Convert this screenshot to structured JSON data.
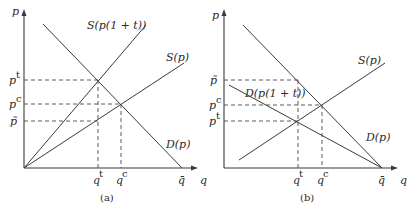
{
  "panels": [
    {
      "id": "a",
      "caption": "(a)",
      "y_axis_label": "p",
      "x_axis_label": "q",
      "curves": [
        {
          "name": "S(p(1+t))",
          "label": "S(p(1 + t))",
          "kind": "supply-with-tax"
        },
        {
          "name": "S(p)",
          "label": "S(p)",
          "kind": "supply"
        },
        {
          "name": "D(p)",
          "label": "D(p)",
          "kind": "demand"
        }
      ],
      "y_ticks": [
        {
          "base": "p",
          "mark": "t",
          "label": "p^t"
        },
        {
          "base": "p",
          "mark": "c",
          "label": "p^c"
        },
        {
          "base": "p̃",
          "mark": "",
          "label": "p̃"
        }
      ],
      "x_ticks": [
        {
          "base": "q",
          "mark": "t",
          "label": "q^t"
        },
        {
          "base": "q",
          "mark": "c",
          "label": "q^c"
        },
        {
          "base": "q̄",
          "mark": "",
          "label": "q̄"
        }
      ]
    },
    {
      "id": "b",
      "caption": "(b)",
      "y_axis_label": "p",
      "x_axis_label": "q",
      "curves": [
        {
          "name": "S(p)",
          "label": "S(p)",
          "kind": "supply"
        },
        {
          "name": "D(p(1+t))",
          "label": "D(p(1 + t))",
          "kind": "demand-with-tax"
        },
        {
          "name": "D(p)",
          "label": "D(p)",
          "kind": "demand"
        }
      ],
      "y_ticks": [
        {
          "base": "p̃",
          "mark": "",
          "label": "p̃"
        },
        {
          "base": "p",
          "mark": "c",
          "label": "p^c"
        },
        {
          "base": "p",
          "mark": "t",
          "label": "p^t"
        }
      ],
      "x_ticks": [
        {
          "base": "q",
          "mark": "t",
          "label": "q^t"
        },
        {
          "base": "q",
          "mark": "c",
          "label": "q^c"
        },
        {
          "base": "q̄",
          "mark": "",
          "label": "q̄"
        }
      ]
    }
  ]
}
